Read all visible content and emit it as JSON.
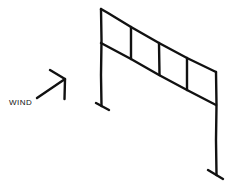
{
  "diagram": {
    "wind_label": "WIND",
    "colors": {
      "ink": "#111111",
      "background": "#ffffff"
    },
    "frame": {
      "left_column": {
        "x": 101,
        "top": 9,
        "bottom": 106
      },
      "right_column": {
        "x": 216,
        "top": 72,
        "bottom": 175
      },
      "top_beam": {
        "x1": 101,
        "y1": 9,
        "x2": 216,
        "y2": 72
      },
      "lower_beam": {
        "x1": 101,
        "y1": 43,
        "x2": 216,
        "y2": 105
      },
      "panel_verticals": [
        131,
        159,
        187
      ],
      "panel_count": 4
    }
  }
}
